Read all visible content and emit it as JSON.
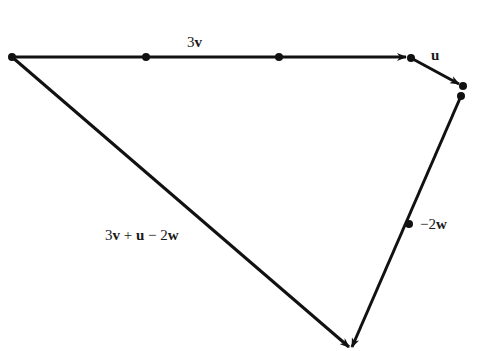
{
  "diagram": {
    "type": "vector-triangle",
    "stroke_color": "#111111",
    "background": "#ffffff",
    "labels": {
      "three_v_coef": "3",
      "three_v_vec": "v",
      "u_vec": "u",
      "neg2w_coef": "−2",
      "neg2w_vec": "w",
      "resultant_part1_coef": "3",
      "resultant_part1_vec": "v",
      "resultant_op1": " + ",
      "resultant_part2_vec": "u",
      "resultant_op2": " − 2",
      "resultant_part3_vec": "w"
    },
    "vectors": [
      {
        "name": "3v",
        "from": [
          12,
          57
        ],
        "to": [
          408,
          57
        ]
      },
      {
        "name": "u",
        "from": [
          411,
          58
        ],
        "to": [
          460,
          84
        ]
      },
      {
        "name": "-2w",
        "from": [
          461,
          96
        ],
        "to": [
          351,
          349
        ]
      },
      {
        "name": "3v + u - 2w",
        "from": [
          12,
          57
        ],
        "to": [
          351,
          349
        ]
      }
    ],
    "points": [
      [
        12,
        57
      ],
      [
        146,
        57
      ],
      [
        279,
        57
      ],
      [
        411,
        58
      ],
      [
        463,
        86
      ],
      [
        461,
        96
      ],
      [
        409,
        224
      ]
    ]
  }
}
